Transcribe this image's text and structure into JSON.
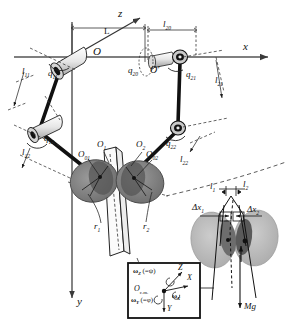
{
  "figure": {
    "type": "kinematic-diagram",
    "axes": {
      "x_label": "x",
      "y_label": "y",
      "z_label": "z"
    },
    "origin_labels": {
      "O": "O",
      "O_prime": "O′"
    }
  },
  "labels": {
    "axis_x": "x",
    "axis_y": "y",
    "axis_z": "z",
    "origin": "O",
    "origin_prime": "O′",
    "L": "L",
    "l20": "l20",
    "l11": "l11",
    "l12": "l12",
    "l21": "l21",
    "l22": "l22",
    "q11": "q11",
    "q12": "q12",
    "q20": "q20",
    "q21": "q21",
    "q22": "q22",
    "O1": "O1",
    "O2": "O2",
    "O01": "O01",
    "O02": "O02",
    "r1": "r1",
    "r2": "r2",
    "l1": "l1",
    "l2": "l2",
    "dx1": "Δx1",
    "dx2": "Δx2",
    "Mg": "Mg"
  },
  "inset": {
    "name": "body-frame-inset",
    "cm": "Oc.m.",
    "omega_z": "ωZ",
    "omega_z_eq": "(=ψ)",
    "omega_y": "ωY",
    "omega_y_eq": "(=φ)",
    "omega_x": "ωX",
    "axis_X": "X",
    "axis_Y": "Y",
    "axis_Z": "Z"
  },
  "colors": {
    "ink": "#1a1a1a",
    "axis": "#555555",
    "wing_light": "#b8b8b8",
    "wing_dark": "#6e6e6e",
    "wing_inner": "#4a4a4a",
    "body_fill": "#f2f2f2",
    "joint_fill": "#d8d8d8",
    "dashed": "#3a3a3a"
  }
}
